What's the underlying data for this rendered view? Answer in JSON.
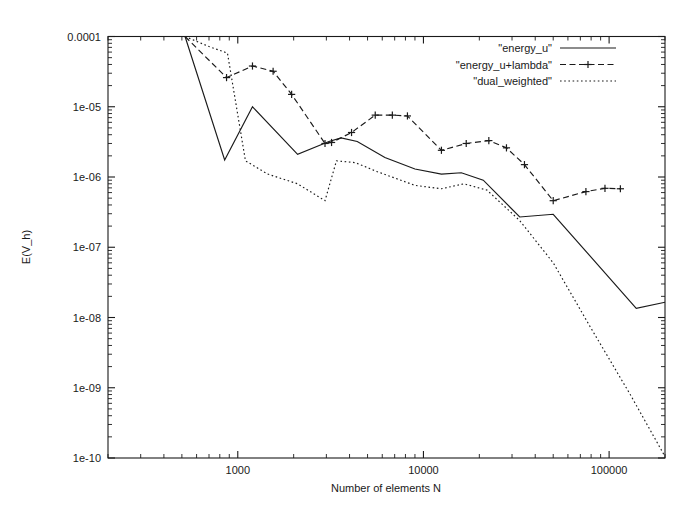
{
  "chart_data": {
    "type": "line",
    "title": "",
    "subtitle": "",
    "xlabel": "Number of elements N",
    "ylabel": "E(V_h)",
    "xscale": "log",
    "yscale": "log",
    "xlim": [
      200,
      200000
    ],
    "ylim": [
      1e-10,
      0.0001
    ],
    "grid": false,
    "legend_position": "top-right",
    "xticks": [
      1000,
      10000,
      100000
    ],
    "xtick_labels": [
      "1000",
      "10000",
      "100000"
    ],
    "yticks": [
      0.0001,
      1e-05,
      1e-06,
      1e-07,
      1e-08,
      1e-09,
      1e-10
    ],
    "ytick_labels": [
      "0.0001",
      "1e-05",
      "1e-06",
      "1e-07",
      "1e-08",
      "1e-09",
      "1e-10"
    ],
    "series": [
      {
        "name": "\"energy_u\"",
        "style": "solid",
        "marker": "none",
        "color": "#1a1a1a",
        "x": [
          520,
          850,
          1200,
          2100,
          3100,
          3600,
          4400,
          6200,
          9000,
          12500,
          16000,
          21000,
          33000,
          50000,
          140000,
          200000
        ],
        "y": [
          0.0001,
          1.75e-06,
          1e-05,
          2.1e-06,
          3.2e-06,
          3.6e-06,
          3.2e-06,
          1.9e-06,
          1.3e-06,
          1.1e-06,
          1.15e-06,
          9e-07,
          2.7e-07,
          2.95e-07,
          1.35e-08,
          1.65e-08
        ]
      },
      {
        "name": "\"energy_u+lambda\"",
        "style": "dashed",
        "marker": "plus",
        "color": "#1a1a1a",
        "x": [
          520,
          870,
          1200,
          1550,
          1950,
          2950,
          3200,
          4100,
          5500,
          6800,
          8200,
          12500,
          17000,
          22500,
          28000,
          35000,
          50000,
          75000,
          95000,
          115000
        ],
        "y": [
          0.0001,
          2.6e-05,
          3.8e-05,
          3.2e-05,
          1.5e-05,
          3e-06,
          3.1e-06,
          4.3e-06,
          7.6e-06,
          7.6e-06,
          7.4e-06,
          2.4e-06,
          3e-06,
          3.3e-06,
          2.6e-06,
          1.5e-06,
          4.6e-07,
          6.2e-07,
          6.9e-07,
          6.8e-07
        ]
      },
      {
        "name": "\"dual_weighted\"",
        "style": "dotted",
        "marker": "none",
        "color": "#1a1a1a",
        "x": [
          520,
          700,
          880,
          1100,
          1450,
          2100,
          2950,
          3400,
          4300,
          5600,
          9000,
          12500,
          16500,
          22000,
          33000,
          50000,
          80000,
          130000,
          200000
        ],
        "y": [
          0.0001,
          7.2e-05,
          5.8e-05,
          1.7e-06,
          1.1e-06,
          8e-07,
          4.6e-07,
          1.7e-06,
          1.6e-06,
          1.2e-06,
          7.6e-07,
          6.8e-07,
          8e-07,
          6.5e-07,
          2.4e-07,
          6e-08,
          7e-09,
          8e-10,
          1.05e-10
        ]
      }
    ]
  },
  "legend": {
    "entries": [
      {
        "label": "\"energy_u\"",
        "style": "solid"
      },
      {
        "label": "\"energy_u+lambda\"",
        "style": "dashed-plus"
      },
      {
        "label": "\"dual_weighted\"",
        "style": "dotted"
      }
    ]
  },
  "colors": {
    "ink": "#1a1a1a",
    "background": "#ffffff"
  }
}
